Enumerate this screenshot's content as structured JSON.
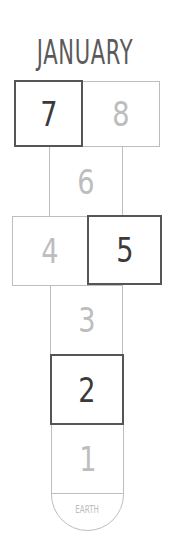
{
  "title": "JANUARY",
  "cells": [
    {
      "number": "7",
      "state": "completed"
    },
    {
      "number": "8",
      "state": "pending"
    },
    {
      "number": "6",
      "state": "pending"
    },
    {
      "number": "4",
      "state": "pending"
    },
    {
      "number": "5",
      "state": "completed"
    },
    {
      "number": "3",
      "state": "pending"
    },
    {
      "number": "2",
      "state": "completed"
    },
    {
      "number": "1",
      "state": "pending"
    }
  ],
  "base": {
    "label": "EARTH"
  },
  "colors": {
    "completed_border": "#555555",
    "pending_border": "#bdbdbd",
    "title": "#5a5a5a"
  }
}
